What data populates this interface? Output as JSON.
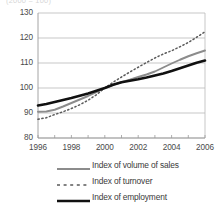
{
  "title_partial": "(2000 = 100)",
  "chart_data": {
    "type": "line",
    "title": "",
    "xlabel": "",
    "ylabel": "",
    "xlim": [
      1996,
      2006
    ],
    "ylim": [
      80,
      130
    ],
    "yticks": [
      80,
      90,
      100,
      110,
      120,
      130
    ],
    "xticks": [
      1996,
      1998,
      2000,
      2002,
      2004,
      2006
    ],
    "grid": true,
    "legend_position": "bottom",
    "x": [
      1996,
      1996.5,
      1997,
      1997.5,
      1998,
      1998.5,
      1999,
      1999.5,
      2000,
      2000.5,
      2001,
      2001.5,
      2002,
      2002.5,
      2003,
      2003.5,
      2004,
      2004.5,
      2005,
      2005.5,
      2006
    ],
    "series": [
      {
        "name": "Index of volume of sales",
        "style": "solid",
        "color": "#8c8c8c",
        "width": 1.9,
        "values": [
          90.5,
          90.6,
          91.3,
          92.6,
          94.0,
          95.4,
          96.8,
          98.3,
          100.0,
          101.3,
          102.3,
          103.3,
          104.4,
          105.4,
          106.6,
          108.2,
          109.8,
          111.3,
          112.7,
          113.9,
          115.0
        ]
      },
      {
        "name": "Index of turnover",
        "style": "dotted",
        "color": "#5a5a5a",
        "width": 1.5,
        "values": [
          87.5,
          88.1,
          89.4,
          90.5,
          91.8,
          93.3,
          95.1,
          97.3,
          100.0,
          102.3,
          104.4,
          106.4,
          108.3,
          110.2,
          112.0,
          113.6,
          114.9,
          116.5,
          118.2,
          120.3,
          122.5
        ]
      },
      {
        "name": "Index of employment",
        "style": "solid",
        "color": "#111111",
        "width": 2.6,
        "values": [
          93.0,
          93.6,
          94.4,
          95.2,
          96.0,
          96.9,
          97.8,
          98.9,
          100.0,
          101.3,
          102.3,
          102.9,
          103.5,
          104.2,
          105.0,
          105.8,
          106.8,
          107.9,
          109.0,
          110.1,
          111.0
        ]
      }
    ]
  },
  "axis": {
    "y_labels": [
      "130",
      "120",
      "110",
      "100",
      "90",
      "80"
    ],
    "x_labels": [
      "1996",
      "1998",
      "2000",
      "2002",
      "2004",
      "2006"
    ]
  },
  "legend": {
    "items": [
      {
        "label": "Index of volume of sales",
        "key": "solid-gray-line-key"
      },
      {
        "label": "Index of turnover",
        "key": "dotted-line-key"
      },
      {
        "label": "Index of employment",
        "key": "solid-black-line-key"
      }
    ]
  }
}
